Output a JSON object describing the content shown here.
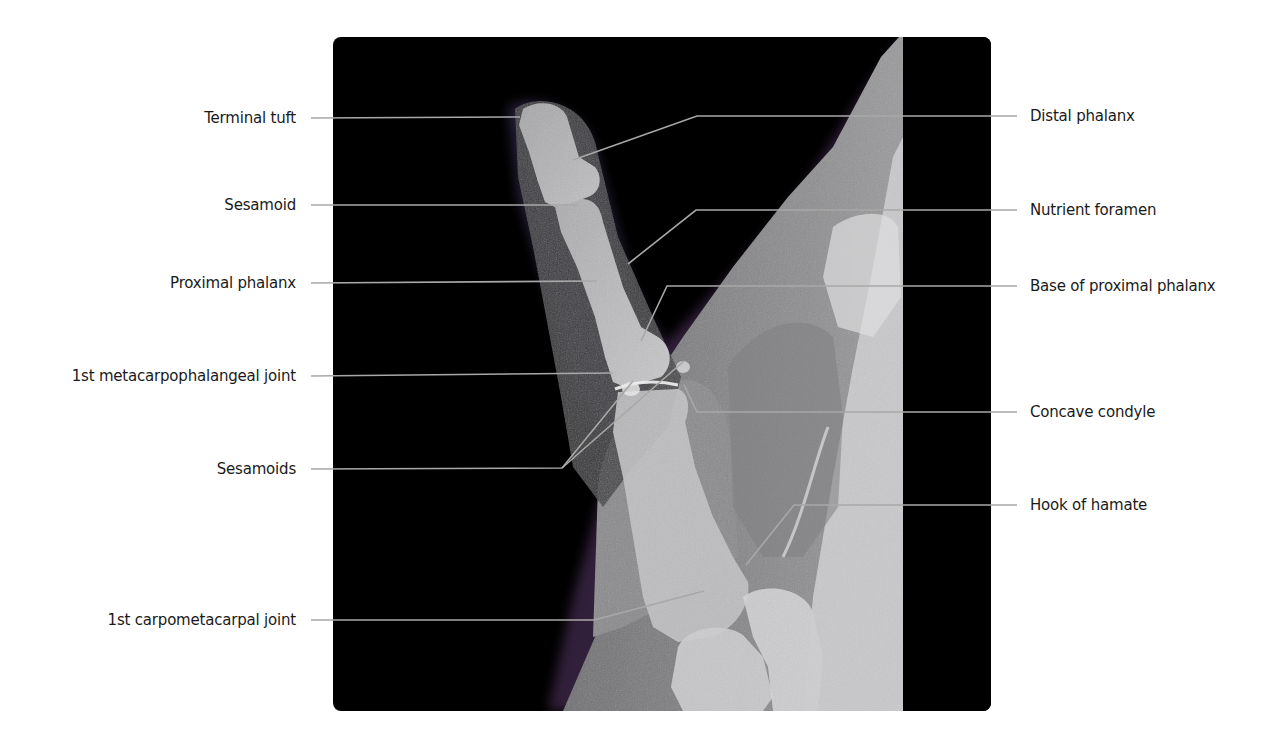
{
  "figure": {
    "colors": {
      "background": "#ffffff",
      "panel": "#000000",
      "leader_line": "#a8a8a8",
      "label_text": "#1a1a1a"
    }
  },
  "labels": {
    "left": [
      {
        "text": "Terminal tuft",
        "label_y": 118,
        "points": [
          [
            311,
            118
          ],
          [
            520,
            117
          ]
        ]
      },
      {
        "text": "Sesamoid",
        "label_y": 205,
        "points": [
          [
            311,
            205
          ],
          [
            578,
            205
          ]
        ]
      },
      {
        "text": "Proximal phalanx",
        "label_y": 283,
        "points": [
          [
            311,
            283
          ],
          [
            597,
            281
          ]
        ]
      },
      {
        "text": "1st metacarpophalangeal joint",
        "label_y": 376,
        "points": [
          [
            311,
            376
          ],
          [
            613,
            373
          ]
        ]
      },
      {
        "text": "Sesamoids",
        "label_y": 469,
        "points": [
          [
            311,
            469
          ],
          [
            562,
            468
          ],
          [
            633,
            381
          ]
        ],
        "extra_points": [
          [
            562,
            468
          ],
          [
            684,
            361
          ]
        ]
      },
      {
        "text": "1st carpometacarpal joint",
        "label_y": 620,
        "points": [
          [
            311,
            620
          ],
          [
            594,
            620
          ],
          [
            704,
            591
          ]
        ]
      }
    ],
    "right": [
      {
        "text": "Distal phalanx",
        "label_y": 116,
        "points": [
          [
            1017,
            116
          ],
          [
            697,
            116
          ],
          [
            573,
            160
          ]
        ]
      },
      {
        "text": "Nutrient foramen",
        "label_y": 210,
        "points": [
          [
            1017,
            210
          ],
          [
            696,
            210
          ],
          [
            628,
            264
          ]
        ]
      },
      {
        "text": "Base of proximal phalanx",
        "label_y": 286,
        "points": [
          [
            1017,
            286
          ],
          [
            667,
            286
          ],
          [
            641,
            341
          ]
        ]
      },
      {
        "text": "Concave condyle",
        "label_y": 412,
        "points": [
          [
            1017,
            412
          ],
          [
            697,
            412
          ],
          [
            684,
            385
          ]
        ]
      },
      {
        "text": "Hook of hamate",
        "label_y": 505,
        "points": [
          [
            1017,
            505
          ],
          [
            794,
            505
          ],
          [
            746,
            565
          ]
        ]
      }
    ]
  }
}
